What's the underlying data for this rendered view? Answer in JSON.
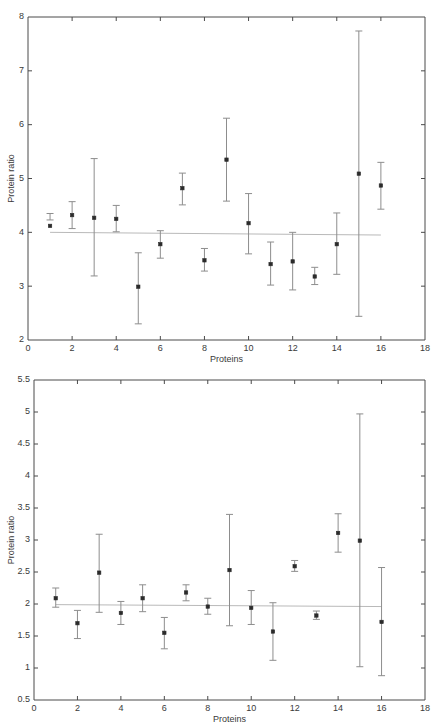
{
  "figure": {
    "background": "#ffffff",
    "axis_color": "#4a4a4a",
    "errorbar_color": "#8d8d8d",
    "marker_color": "#2b2b2b",
    "refline_color": "#b9b9b9"
  },
  "chart_data": [
    {
      "type": "scatter",
      "panel": "top",
      "title": "",
      "xlabel": "Proteins",
      "ylabel": "Protein ratio",
      "xlim": [
        0,
        18
      ],
      "ylim": [
        2,
        8
      ],
      "xticks": [
        0,
        2,
        4,
        6,
        8,
        10,
        12,
        14,
        16,
        18
      ],
      "xticklabels": [
        "0",
        "2",
        "4",
        "6",
        "8",
        "10",
        "12",
        "14",
        "16",
        "18"
      ],
      "yticks": [
        2,
        3,
        4,
        5,
        6,
        7,
        8
      ],
      "yticklabels": [
        "2",
        "3",
        "4",
        "5",
        "6",
        "7",
        "8"
      ],
      "grid": false,
      "legend": "none",
      "reference_line": {
        "y_start": 4.0,
        "y_end": 3.95,
        "x_start": 1,
        "x_end": 16
      },
      "x": [
        1,
        2,
        3,
        4,
        5,
        6,
        7,
        8,
        9,
        10,
        11,
        12,
        13,
        14,
        15,
        16
      ],
      "values": [
        4.12,
        4.32,
        4.27,
        4.25,
        2.99,
        3.78,
        4.82,
        3.48,
        5.35,
        4.17,
        3.41,
        3.46,
        3.18,
        3.78,
        5.09,
        4.87
      ],
      "err_low": [
        4.23,
        4.07,
        3.19,
        4.01,
        2.3,
        3.52,
        4.51,
        3.28,
        4.58,
        3.6,
        3.02,
        2.93,
        3.03,
        3.22,
        2.44,
        4.43
      ],
      "err_high": [
        4.35,
        4.57,
        5.37,
        4.5,
        3.62,
        4.03,
        5.1,
        3.7,
        6.12,
        4.72,
        3.82,
        4.0,
        3.35,
        4.36,
        7.74,
        5.3
      ],
      "yerr_lower": [
        0.22,
        0.25,
        1.08,
        0.24,
        0.69,
        0.26,
        0.31,
        0.2,
        0.77,
        0.57,
        0.39,
        0.53,
        0.15,
        0.56,
        2.65,
        0.44
      ],
      "yerr_upper": [
        0.23,
        0.25,
        1.1,
        0.25,
        0.63,
        0.25,
        0.28,
        0.22,
        0.77,
        0.55,
        0.41,
        0.54,
        0.17,
        0.58,
        2.65,
        0.43
      ]
    },
    {
      "type": "scatter",
      "panel": "bottom",
      "title": "",
      "xlabel": "Proteins",
      "ylabel": "Protein ratio",
      "xlim": [
        0,
        18
      ],
      "ylim": [
        0.5,
        5.5
      ],
      "xticks": [
        0,
        2,
        4,
        6,
        8,
        10,
        12,
        14,
        16,
        18
      ],
      "xticklabels": [
        "0",
        "2",
        "4",
        "6",
        "8",
        "10",
        "12",
        "14",
        "16",
        "18"
      ],
      "yticks": [
        0.5,
        1,
        1.5,
        2,
        2.5,
        3,
        3.5,
        4,
        4.5,
        5,
        5.5
      ],
      "yticklabels": [
        "0.5",
        "1",
        "1.5",
        "2",
        "2.5",
        "3",
        "3.5",
        "4",
        "4.5",
        "5",
        "5.5"
      ],
      "grid": false,
      "legend": "none",
      "reference_line": {
        "y_start": 1.99,
        "y_end": 1.96,
        "x_start": 1,
        "x_end": 16
      },
      "x": [
        1,
        2,
        3,
        4,
        5,
        6,
        7,
        8,
        9,
        10,
        11,
        12,
        13,
        14,
        15,
        16
      ],
      "values": [
        2.09,
        1.7,
        2.49,
        1.86,
        2.09,
        1.55,
        2.18,
        1.96,
        2.53,
        1.94,
        1.57,
        2.59,
        1.82,
        3.11,
        2.99,
        1.72
      ],
      "err_low": [
        1.95,
        1.46,
        1.87,
        1.68,
        1.88,
        1.3,
        2.05,
        1.84,
        1.66,
        1.68,
        1.12,
        2.51,
        1.76,
        2.81,
        1.02,
        0.88
      ],
      "err_high": [
        2.25,
        1.9,
        3.09,
        2.04,
        2.3,
        1.79,
        2.3,
        2.09,
        3.4,
        2.21,
        2.02,
        2.68,
        1.89,
        3.41,
        4.97,
        2.57
      ],
      "yerr_lower": [
        0.14,
        0.24,
        0.62,
        0.18,
        0.21,
        0.25,
        0.13,
        0.12,
        0.87,
        0.26,
        0.45,
        0.08,
        0.06,
        0.3,
        1.97,
        0.84
      ],
      "yerr_upper": [
        0.16,
        0.2,
        0.6,
        0.18,
        0.21,
        0.24,
        0.12,
        0.13,
        0.87,
        0.27,
        0.45,
        0.09,
        0.07,
        0.3,
        1.98,
        0.85
      ]
    }
  ]
}
